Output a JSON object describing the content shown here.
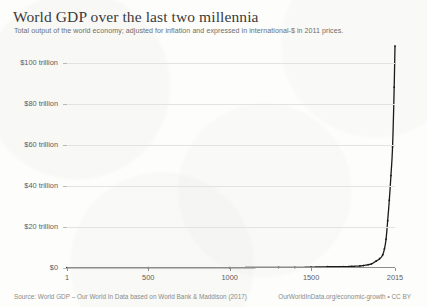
{
  "header": {
    "title": "World GDP over the last two millennia",
    "subtitle": "Total output of the world economy; adjusted for inflation and expressed in international-$ in 2011 prices."
  },
  "footer": {
    "source": "Source: World GDP – Our World In Data based on World Bank & Maddison (2017)",
    "credit": "OurWorldInData.org/economic-growth • CC BY"
  },
  "colors": {
    "line": "#1a1a1a",
    "grid": "#e3e3e0",
    "axis": "#8d8d8a",
    "title_text": "#3b3b3b",
    "subtitle_text": "#6e6e6e",
    "tick_text": "#5d5d5d",
    "footer_text": "#8b8b88",
    "background": "#fdfdfb"
  },
  "chart_data": {
    "type": "line",
    "title": "World GDP over the last two millennia",
    "subtitle": "Total output of the world economy; adjusted for inflation and expressed in international-$ in 2011 prices.",
    "xlabel": "",
    "ylabel": "",
    "xlim": [
      1,
      2015
    ],
    "ylim": [
      0,
      110
    ],
    "y_unit": "trillion international-$ (2011 prices)",
    "grid": true,
    "legend": "none",
    "yticks": [
      0,
      20,
      40,
      60,
      80,
      100
    ],
    "ytick_labels": [
      "$0",
      "$20 trillion",
      "$40 trillion",
      "$60 trillion",
      "$80 trillion",
      "$100 trillion"
    ],
    "xticks": [
      1,
      500,
      1000,
      1500,
      2015
    ],
    "xtick_labels": [
      "1",
      "500",
      "1000",
      "1500",
      "2015"
    ],
    "series": [
      {
        "name": "World GDP",
        "x": [
          1,
          500,
          1000,
          1300,
          1400,
          1500,
          1600,
          1700,
          1750,
          1800,
          1820,
          1850,
          1870,
          1900,
          1920,
          1940,
          1950,
          1960,
          1970,
          1980,
          1990,
          2000,
          2010,
          2015
        ],
        "values": [
          0.18,
          0.2,
          0.21,
          0.29,
          0.28,
          0.43,
          0.6,
          0.64,
          0.8,
          1.0,
          1.2,
          1.6,
          2.0,
          3.4,
          4.5,
          6.5,
          9.3,
          14.0,
          23.0,
          33.0,
          45.0,
          59.0,
          88.0,
          108.0
        ]
      }
    ]
  }
}
